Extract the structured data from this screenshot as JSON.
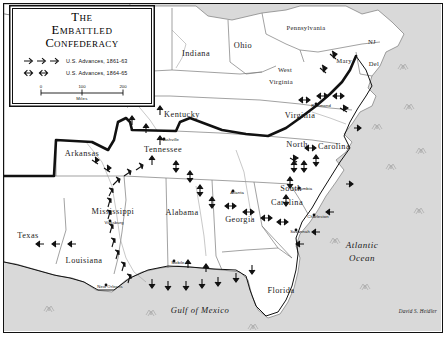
{
  "map": {
    "title_lines": [
      "The",
      "Embattled",
      "Confederacy"
    ],
    "credit": "David S. Heidler",
    "legend": {
      "entries": [
        {
          "symbol": "single-arrow",
          "label": "U.S. Advances, 1861-63"
        },
        {
          "symbol": "double-arrow",
          "label": "U.S. Advances, 1864-65"
        }
      ],
      "scale": {
        "ticks": [
          "0",
          "100",
          "200"
        ],
        "unit": "Miles"
      }
    },
    "states": [
      {
        "name": "Indiana",
        "x": 196,
        "y": 56,
        "size": "lg"
      },
      {
        "name": "Ohio",
        "x": 243,
        "y": 48,
        "size": "lg"
      },
      {
        "name": "Pennsylvania",
        "x": 306,
        "y": 30,
        "size": "sm"
      },
      {
        "name": "NJ",
        "x": 372,
        "y": 44,
        "size": "sm"
      },
      {
        "name": "Del",
        "x": 374,
        "y": 66,
        "size": "sm"
      },
      {
        "name": "Mary",
        "x": 344,
        "y": 63,
        "size": "sm"
      },
      {
        "name": "West",
        "x": 285,
        "y": 72,
        "size": "sm"
      },
      {
        "name": "Virginia",
        "x": 281,
        "y": 84,
        "size": "sm"
      },
      {
        "name": "Kentucky",
        "x": 182,
        "y": 117,
        "size": "lg"
      },
      {
        "name": "Virginia",
        "x": 300,
        "y": 118,
        "size": "lg"
      },
      {
        "name": "Tennessee",
        "x": 163,
        "y": 152,
        "size": "lg"
      },
      {
        "name": "Arkansas",
        "x": 82,
        "y": 156,
        "size": "lg"
      },
      {
        "name": "North",
        "x": 297,
        "y": 147,
        "size": "lg"
      },
      {
        "name": "Carolina",
        "x": 334,
        "y": 149,
        "size": "lg"
      },
      {
        "name": "South",
        "x": 291,
        "y": 191,
        "size": "lg"
      },
      {
        "name": "Carolina",
        "x": 287,
        "y": 205,
        "size": "lg"
      },
      {
        "name": "Mississippi",
        "x": 113,
        "y": 214,
        "size": "lg"
      },
      {
        "name": "Alabama",
        "x": 182,
        "y": 215,
        "size": "lg"
      },
      {
        "name": "Georgia",
        "x": 240,
        "y": 222,
        "size": "lg"
      },
      {
        "name": "Texas",
        "x": 28,
        "y": 238,
        "size": "lg"
      },
      {
        "name": "Louisiana",
        "x": 84,
        "y": 263,
        "size": "lg"
      },
      {
        "name": "Florida",
        "x": 281,
        "y": 293,
        "size": "lg"
      }
    ],
    "cities": [
      {
        "name": "Richmond",
        "x": 321,
        "y": 107
      },
      {
        "name": "Nashville",
        "x": 170,
        "y": 141
      },
      {
        "name": "Columbia",
        "x": 303,
        "y": 190
      },
      {
        "name": "Charleston",
        "x": 318,
        "y": 218
      },
      {
        "name": "Savannah",
        "x": 300,
        "y": 233
      },
      {
        "name": "Atlanta",
        "x": 237,
        "y": 194
      },
      {
        "name": "Vicksburg",
        "x": 114,
        "y": 224
      },
      {
        "name": "Mobile",
        "x": 178,
        "y": 264
      },
      {
        "name": "New Orleans",
        "x": 110,
        "y": 288
      }
    ],
    "water_labels": [
      {
        "name": "Atlantic Ocean",
        "lines": [
          "Atlantic",
          "Ocean"
        ],
        "x": 362,
        "y": 248
      },
      {
        "name": "Gulf of Mexico",
        "lines": [
          "Gulf of Mexico"
        ],
        "x": 200,
        "y": 313
      }
    ],
    "colors": {
      "water": "#d9d9d9",
      "land": "#ffffff",
      "state_border": "#7a7a7a",
      "confederacy_border": "#111111",
      "ink": "#111111"
    }
  }
}
